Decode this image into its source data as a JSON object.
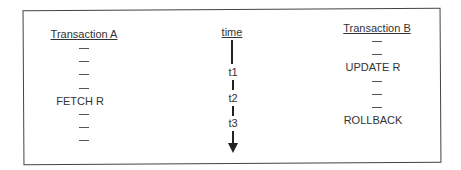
{
  "transaction_a": {
    "header": "Transaction A",
    "steps": [
      "—",
      "—",
      "—",
      "—",
      "FETCH R",
      "—",
      "—",
      "—"
    ]
  },
  "time": {
    "header": "time",
    "marks": [
      "t1",
      "t2",
      "t3"
    ]
  },
  "transaction_b": {
    "header": "Transaction B",
    "steps": [
      "—",
      "—",
      "UPDATE R",
      "—",
      "—",
      "—",
      "ROLLBACK"
    ]
  }
}
